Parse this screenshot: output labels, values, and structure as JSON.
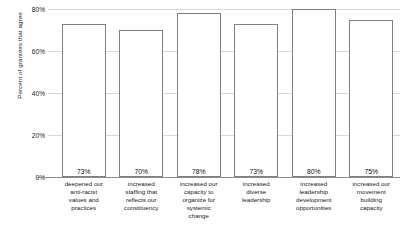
{
  "chart_data": {
    "type": "bar",
    "title": "",
    "xlabel": "",
    "ylabel": "Percent of grantees that agree",
    "ylim": [
      0,
      80
    ],
    "grid": true,
    "legend": "none",
    "yticks": [
      "0%",
      "20%",
      "40%",
      "60%",
      "80%"
    ],
    "ytick_values": [
      0,
      20,
      40,
      60,
      80
    ],
    "categories": [
      "deepened our anti-racist values and practices",
      "increased staffing that reflects our constituency",
      "increased our capacity to organize for systemic change",
      "increased diverse leadership",
      "increased leadership development opportunities",
      "increased our movement building capacity"
    ],
    "category_lines": [
      [
        "deepened our",
        "anti-racist",
        "values and",
        "practices"
      ],
      [
        "increased",
        "staffing that",
        "reflects our",
        "constituency"
      ],
      [
        "increased our",
        "capacity to",
        "organize for",
        "systemic",
        "change"
      ],
      [
        "increased",
        "diverse",
        "leadership"
      ],
      [
        "increased",
        "leadership",
        "development",
        "opportunities"
      ],
      [
        "increased our",
        "movement",
        "building",
        "capacity"
      ]
    ],
    "values": [
      73,
      70,
      78,
      73,
      80,
      75
    ],
    "value_labels": [
      "73%",
      "70%",
      "78%",
      "73%",
      "80%",
      "75%"
    ],
    "colors": {
      "bar_fill": "#ffffff",
      "bar_stroke": "#808080",
      "gridline": "#d9d9d9",
      "axis": "#8c8c8c",
      "text": "#1a1a1a",
      "background": "#ffffff"
    }
  }
}
